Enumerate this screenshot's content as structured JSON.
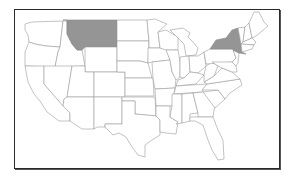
{
  "map": {
    "title": "",
    "region": "Contiguous United States",
    "highlight_color": "#959595",
    "default_fill": "#ffffff",
    "border_color": "#9a9a9a",
    "frame_color": "#2a2a2a",
    "highlighted_states": [
      "Montana",
      "New York"
    ]
  }
}
